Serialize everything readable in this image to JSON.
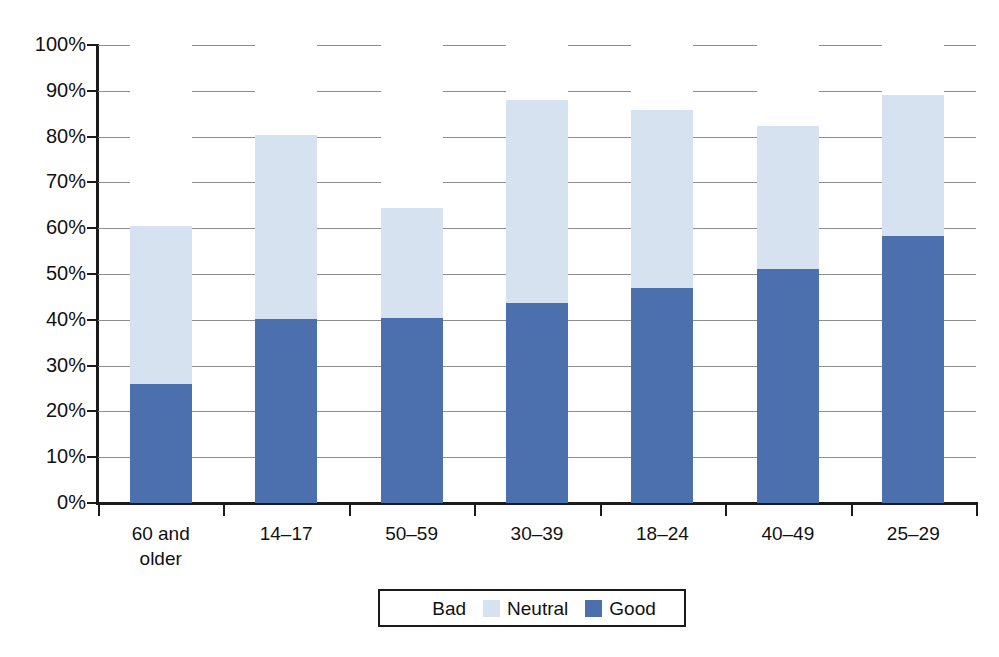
{
  "chart_data": {
    "type": "bar",
    "subtype": "stacked-bar-100-percent",
    "title": "",
    "xlabel": "",
    "ylabel": "",
    "ylim": [
      0,
      100
    ],
    "ytick_labels": [
      "100%",
      "90%",
      "80%",
      "70%",
      "60%",
      "50%",
      "40%",
      "30%",
      "20%",
      "10%",
      "0%"
    ],
    "ytick_values": [
      100,
      90,
      80,
      70,
      60,
      50,
      40,
      30,
      20,
      10,
      0
    ],
    "grid": true,
    "legend_position": "bottom",
    "categories": [
      "60 and\nolder",
      "14–17",
      "50–59",
      "30–39",
      "18–24",
      "40–49",
      "25–29"
    ],
    "category_lines": [
      [
        "60 and",
        "older"
      ],
      [
        "14–17",
        ""
      ],
      [
        "50–59",
        ""
      ],
      [
        "30–39",
        ""
      ],
      [
        "18–24",
        ""
      ],
      [
        "40–49",
        ""
      ],
      [
        "25–29",
        ""
      ]
    ],
    "series": [
      {
        "name": "Good",
        "color": "#4c6fad",
        "values": [
          26,
          40.2,
          40.4,
          43.6,
          47,
          51,
          58.3
        ]
      },
      {
        "name": "Neutral",
        "color": "#d7e2f1",
        "values": [
          34.5,
          40.1,
          24.1,
          44.3,
          38.9,
          31.4,
          30.7
        ]
      },
      {
        "name": "Bad",
        "color": "#ffffff",
        "values": [
          39.5,
          19.7,
          35.5,
          12.1,
          14.1,
          17.6,
          11.0
        ]
      }
    ],
    "cumulative_tops": {
      "good": [
        26,
        40.2,
        40.4,
        43.6,
        47,
        51,
        58.3
      ],
      "good_plus_neutral": [
        60.5,
        80.3,
        64.5,
        87.9,
        85.9,
        82.4,
        89.0
      ],
      "total": [
        100,
        100,
        100,
        100,
        100,
        100,
        100
      ]
    }
  },
  "legend": {
    "items": [
      {
        "label": "Bad",
        "swatch": "bad"
      },
      {
        "label": "Neutral",
        "swatch": "neutral"
      },
      {
        "label": "Good",
        "swatch": "good"
      }
    ]
  },
  "colors": {
    "good": "#4c6fad",
    "neutral": "#d7e2f1",
    "bad": "#ffffff",
    "axis": "#1b1b1b",
    "gridline": "#8d8d8d",
    "background": "#ffffff"
  }
}
